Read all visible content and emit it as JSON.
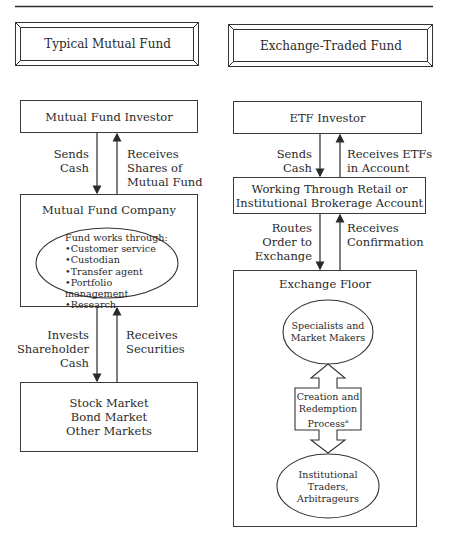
{
  "headers": {
    "left": "Typical Mutual Fund",
    "right": "Exchange-Traded Fund"
  },
  "mutual_fund": {
    "investor": "Mutual Fund Investor",
    "sends_cash": [
      "Sends",
      "Cash"
    ],
    "receives_shares": [
      "Receives",
      "Shares of",
      "Mutual Fund"
    ],
    "company": "Mutual Fund Company",
    "works_through_title": "Fund  works through:",
    "works_through_items": [
      "•Customer service",
      "•Custodian",
      "•Transfer agent",
      "•Portfolio management",
      "•Research"
    ],
    "invests": [
      "Invests",
      "Shareholder",
      "Cash"
    ],
    "receives_securities": [
      "Receives",
      "Securities"
    ],
    "markets": [
      "Stock Market",
      "Bond Market",
      "Other Markets"
    ]
  },
  "etf": {
    "investor": "ETF Investor",
    "sends_cash": [
      "Sends",
      "Cash"
    ],
    "receives_etfs": [
      "Receives ETFs",
      "in Account"
    ],
    "broker": [
      "Working Through Retail or",
      "Institutional Brokerage Account"
    ],
    "routes_order": [
      "Routes",
      "Order to",
      "Exchange"
    ],
    "receives_confirmation": [
      "Receives",
      "Confirmation"
    ],
    "exchange_floor": "Exchange Floor",
    "specialists": [
      "Specialists and",
      "Market Makers"
    ],
    "creation": [
      "Creation and",
      "Redemption",
      "Process"
    ],
    "creation_footnote": "a",
    "institutional": [
      "Institutional",
      "Traders,",
      "Arbitrageurs"
    ]
  }
}
